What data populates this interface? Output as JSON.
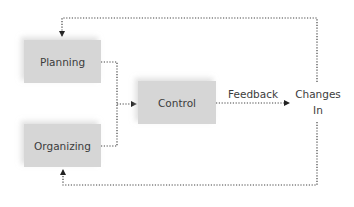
{
  "diagram": {
    "type": "flow",
    "nodes": [
      {
        "id": "planning",
        "label": "Planning"
      },
      {
        "id": "organizing",
        "label": "Organizing"
      },
      {
        "id": "control",
        "label": "Control"
      },
      {
        "id": "changes_in",
        "label_line1": "Changes",
        "label_line2": "In"
      }
    ],
    "edge_labels": {
      "feedback": "Feedback"
    },
    "edges": [
      {
        "from": "planning",
        "to": "control",
        "style": "dotted"
      },
      {
        "from": "organizing",
        "to": "control",
        "style": "dotted"
      },
      {
        "from": "control",
        "to": "changes_in",
        "label": "Feedback",
        "style": "dotted"
      },
      {
        "from": "changes_in",
        "to": "planning",
        "style": "dotted"
      },
      {
        "from": "changes_in",
        "to": "organizing",
        "style": "dotted"
      }
    ],
    "colors": {
      "box_fill": "#d6d6d6",
      "line": "#333333",
      "text": "#3c3c3c"
    }
  }
}
